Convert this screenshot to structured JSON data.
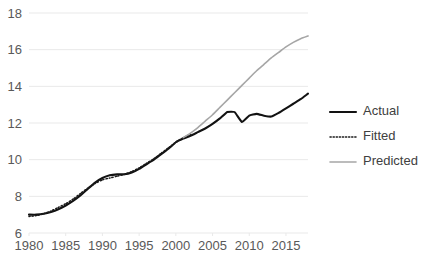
{
  "chart_data": {
    "type": "line",
    "title": "",
    "xlabel": "",
    "ylabel": "",
    "xlim": [
      1980,
      2018
    ],
    "ylim": [
      6,
      18
    ],
    "grid": true,
    "legend_position": "right",
    "x_ticks": [
      "1980",
      "1985",
      "1990",
      "1995",
      "2000",
      "2005",
      "2010",
      "2015"
    ],
    "x_tick_values": [
      1980,
      1985,
      1990,
      1995,
      2000,
      2005,
      2010,
      2015
    ],
    "y_ticks": [
      "6",
      "8",
      "10",
      "12",
      "14",
      "16",
      "18"
    ],
    "y_tick_values": [
      6,
      8,
      10,
      12,
      14,
      16,
      18
    ],
    "series": [
      {
        "name": "Actual",
        "style": "solid-thick",
        "color": "#121212",
        "x": [
          1980,
          1981,
          1982,
          1983,
          1984,
          1985,
          1986,
          1987,
          1988,
          1989,
          1990,
          1991,
          1992,
          1993,
          1994,
          1995,
          1996,
          1997,
          1998,
          1999,
          2000,
          2001,
          2002,
          2003,
          2004,
          2005,
          2006,
          2007,
          2008,
          2009,
          2010,
          2011,
          2012,
          2013,
          2014,
          2015,
          2016,
          2017,
          2018
        ],
        "values": [
          7.0,
          7.0,
          7.05,
          7.15,
          7.3,
          7.5,
          7.75,
          8.05,
          8.4,
          8.75,
          9.0,
          9.15,
          9.2,
          9.2,
          9.3,
          9.5,
          9.75,
          10.0,
          10.3,
          10.6,
          10.95,
          11.15,
          11.3,
          11.5,
          11.7,
          11.95,
          12.25,
          12.6,
          12.6,
          12.05,
          12.4,
          12.5,
          12.4,
          12.35,
          12.55,
          12.8,
          13.05,
          13.3,
          13.6
        ]
      },
      {
        "name": "Fitted",
        "style": "dotted",
        "color": "#1a1a1a",
        "x": [
          1980,
          1981,
          1982,
          1983,
          1984,
          1985,
          1986,
          1987,
          1988,
          1989,
          1990,
          1991,
          1992,
          1993,
          1994,
          1995,
          1996,
          1997,
          1998,
          1999,
          2000,
          2001,
          2002
        ],
        "values": [
          6.9,
          6.95,
          7.05,
          7.2,
          7.4,
          7.6,
          7.85,
          8.15,
          8.45,
          8.7,
          8.9,
          9.0,
          9.1,
          9.2,
          9.35,
          9.55,
          9.8,
          10.05,
          10.35,
          10.65,
          10.95,
          11.2,
          11.4
        ]
      },
      {
        "name": "Predicted",
        "style": "solid-thin",
        "color": "#a6a6a6",
        "x": [
          2001,
          2002,
          2003,
          2004,
          2005,
          2006,
          2007,
          2008,
          2009,
          2010,
          2011,
          2012,
          2013,
          2014,
          2015,
          2016,
          2017,
          2018
        ],
        "values": [
          11.2,
          11.45,
          11.75,
          12.1,
          12.45,
          12.85,
          13.25,
          13.65,
          14.05,
          14.45,
          14.85,
          15.2,
          15.55,
          15.85,
          16.15,
          16.4,
          16.6,
          16.75
        ]
      }
    ]
  },
  "legend": {
    "items": [
      {
        "label": "Actual",
        "style": "solid-thick",
        "color": "#121212"
      },
      {
        "label": "Fitted",
        "style": "dotted",
        "color": "#1a1a1a"
      },
      {
        "label": "Predicted",
        "style": "solid-thin",
        "color": "#a6a6a6"
      }
    ]
  }
}
